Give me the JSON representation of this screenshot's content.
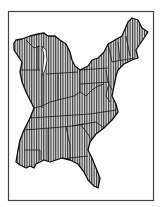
{
  "figure": {
    "type": "map",
    "fill_pattern": "vertical-hatch",
    "colors": {
      "background": "#ffffff",
      "frame": "#444444",
      "outline": "#1a1a1a",
      "hatch": "#333333",
      "hatch_background": "#d8d8d8"
    },
    "labels": []
  }
}
